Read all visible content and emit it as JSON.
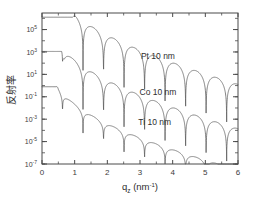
{
  "chart_data": {
    "type": "line",
    "title": "",
    "xlabel": "q_z (nm^-1)",
    "xlabel_base": "q",
    "xlabel_sub": "z",
    "xlabel_unit_open": " (nm",
    "xlabel_unit_sup": "-1",
    "xlabel_unit_close": ")",
    "ylabel": "反射率",
    "yscale": "log",
    "xscale": "linear",
    "xlim": [
      0,
      6
    ],
    "ylim": [
      1e-07,
      3000000.0
    ],
    "grid": false,
    "legend_position": "inline-annotations",
    "xticks": [
      0,
      1,
      2,
      3,
      4,
      5,
      6
    ],
    "xticklabels": [
      "0",
      "1",
      "2",
      "3",
      "4",
      "5",
      "6"
    ],
    "yticks_exponents": [
      5,
      3,
      1,
      -1,
      -3,
      -5,
      -7
    ],
    "yticklabels": [
      "10^5",
      "10^3",
      "10^1",
      "10^-1",
      "10^-3",
      "10^-5",
      "10^-7"
    ],
    "ytick_mantissa": "10",
    "ytick_exponent_strings": [
      "5",
      "3",
      "1",
      "-1",
      "-3",
      "-5",
      "-7"
    ],
    "annotations": [
      {
        "text": "Pt 10 nm",
        "x": 3.55,
        "y_exp": 2.35
      },
      {
        "text": "Co 10 nm",
        "x": 3.55,
        "y_exp": -0.85
      },
      {
        "text": "Ti 10 nm",
        "x": 3.45,
        "y_exp": -3.55
      }
    ],
    "series": [
      {
        "name": "Pt 10 nm",
        "material": "Pt",
        "thickness_nm": 10,
        "plateau_log10": 6.1,
        "qc": 0.93,
        "fringe_period": 0.628,
        "fringe_depth": 1.55,
        "decay_per_unit_q": 0.62,
        "color": "#5a5a5a"
      },
      {
        "name": "Co 10 nm",
        "material": "Co",
        "thickness_nm": 10,
        "plateau_log10": 3.05,
        "qc": 0.6,
        "fringe_period": 0.628,
        "fringe_depth": 1.35,
        "decay_per_unit_q": 0.6,
        "color": "#5a5a5a"
      },
      {
        "name": "Ti 10 nm",
        "material": "Ti",
        "thickness_nm": 10,
        "plateau_log10": -0.1,
        "qc": 0.44,
        "fringe_period": 0.628,
        "fringe_depth": 0.72,
        "decay_per_unit_q": 0.55,
        "color": "#5a5a5a"
      }
    ]
  },
  "plot_geometry": {
    "left": 42,
    "right": 238,
    "top": 13,
    "bottom": 164
  }
}
